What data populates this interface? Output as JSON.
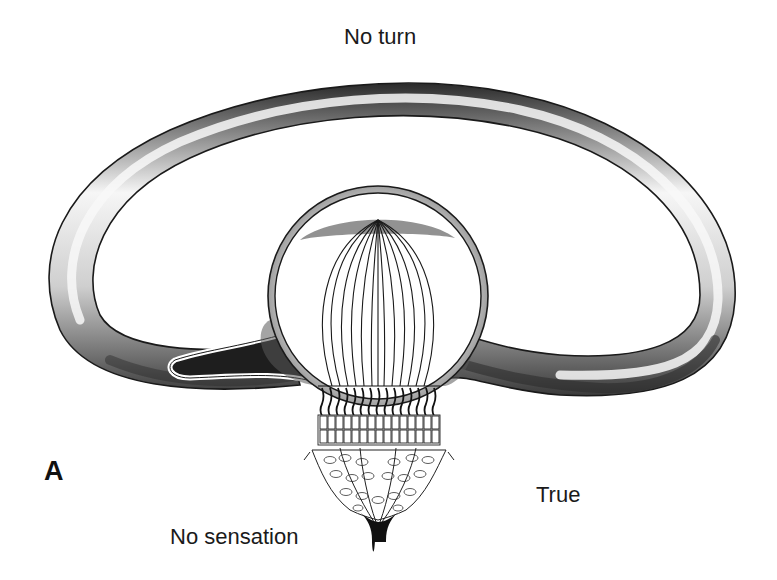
{
  "figure": {
    "panel_letter": "A",
    "labels": {
      "top": "No turn",
      "bottom_left": "No sensation",
      "bottom_right": "True"
    },
    "parts": [
      "semicircular-canal",
      "ampulla",
      "cupula",
      "crista-hair-cells",
      "supporting-cells",
      "vestibular-nerve"
    ],
    "colors": {
      "background": "#ffffff",
      "outline": "#1a1a1a",
      "shade_dark": "#3a3a3a",
      "shade_light": "#f4f4f4"
    }
  }
}
